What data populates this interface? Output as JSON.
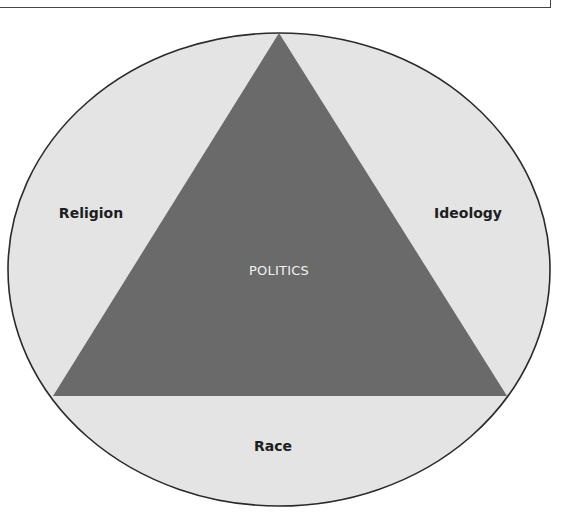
{
  "diagram": {
    "type": "triangle-in-ellipse",
    "center_label": "POLITICS",
    "outer_labels": {
      "left": "Religion",
      "right": "Ideology",
      "bottom": "Race"
    },
    "colors": {
      "ellipse_fill": "#e4e4e4",
      "ellipse_stroke": "#2a2a2a",
      "triangle_fill": "#6a6a6a",
      "label_text": "#1e1e1e",
      "center_text": "#f2f2f2"
    }
  }
}
